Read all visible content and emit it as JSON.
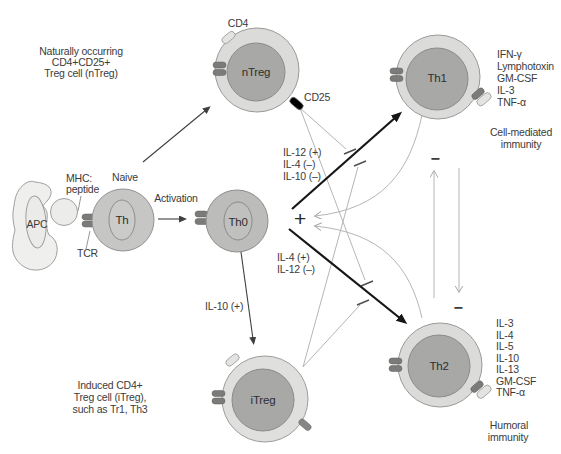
{
  "cells": {
    "apc": "APC",
    "naive": "Th",
    "th0": "Th0",
    "ntreg": "nTreg",
    "th1": "Th1",
    "th2": "Th2",
    "itreg": "iTreg"
  },
  "receptors": {
    "mhc_line1": "MHC:",
    "mhc_line2": "peptide",
    "tcr": "TCR",
    "cd4": "CD4",
    "cd25": "CD25"
  },
  "process": {
    "naive_caption": "Naive",
    "activation": "Activation"
  },
  "signals": {
    "th1_induction": [
      "IL-12 (+)",
      "IL-4 (–)",
      "IL-10 (–)"
    ],
    "th2_induction": [
      "IL-4 (+)",
      "IL-12 (–)"
    ],
    "itreg_induction": "IL-10 (+)",
    "plus": "+",
    "minus_upper": "−",
    "minus_lower": "−"
  },
  "notes": {
    "ntreg": [
      "Naturally occurring",
      "CD4+CD25+",
      "Treg cell (nTreg)"
    ],
    "itreg": [
      "Induced CD4+",
      "Treg cell (iTreg),",
      "such as Tr1, Th3"
    ]
  },
  "outputs": {
    "th1_cytokines": [
      "IFN-γ",
      "Lymphotoxin",
      "GM-CSF",
      "IL-3",
      "TNF-α"
    ],
    "th1_function": [
      "Cell-mediated",
      "immunity"
    ],
    "th2_cytokines": [
      "IL-3",
      "IL-4",
      "IL-5",
      "IL-10",
      "IL-13",
      "GM-CSF",
      "TNF-α"
    ],
    "th2_function": [
      "Humoral",
      "immunity"
    ]
  },
  "palette": {
    "cell_outer_ring": "#dbdbd9",
    "cell_inner": "#a8a8a6",
    "th0_fill": "#bcbcba",
    "naive_fill": "#c6c6c4",
    "apc_fill": "#efefed",
    "dark_receptor": "#7b7b79",
    "light_receptor": "#e3e3e1",
    "gray_line": "#b5b5b3",
    "ink": "#3b3b3b"
  }
}
